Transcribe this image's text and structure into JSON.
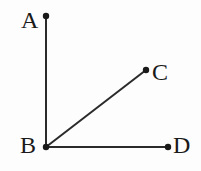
{
  "figure": {
    "type": "geometry-diagram",
    "background_color": "#fdfdfd",
    "stroke_color": "#2b2b2b",
    "label_color": "#1a1a1a",
    "canvas": {
      "width": 201,
      "height": 171
    },
    "points": [
      {
        "id": "A",
        "label": "A",
        "x": 46,
        "y": 16,
        "dot_radius": 3.2,
        "label_x": 21,
        "label_y": 8
      },
      {
        "id": "B",
        "label": "B",
        "x": 46,
        "y": 147,
        "dot_radius": 3.2,
        "label_x": 20,
        "label_y": 133
      },
      {
        "id": "C",
        "label": "C",
        "x": 146,
        "y": 70,
        "dot_radius": 3.2,
        "label_x": 152,
        "label_y": 60
      },
      {
        "id": "D",
        "label": "D",
        "x": 168,
        "y": 147,
        "dot_radius": 3.2,
        "label_x": 173,
        "label_y": 133
      }
    ],
    "segments": [
      {
        "id": "BA",
        "from": "B",
        "to": "A",
        "x1": 46,
        "y1": 147,
        "x2": 46,
        "y2": 16,
        "width": 2
      },
      {
        "id": "BC",
        "from": "B",
        "to": "C",
        "x1": 46,
        "y1": 147,
        "x2": 146,
        "y2": 70,
        "width": 2
      },
      {
        "id": "BD",
        "from": "B",
        "to": "D",
        "x1": 46,
        "y1": 147,
        "x2": 168,
        "y2": 147,
        "width": 2
      }
    ]
  }
}
